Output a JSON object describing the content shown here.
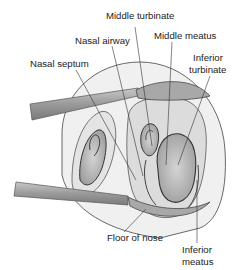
{
  "diagram": {
    "labels": {
      "middle_turbinate": "Middle turbinate",
      "middle_meatus": "Middle meatus",
      "nasal_airway": "Nasal airway",
      "nasal_septum": "Nasal septum",
      "inferior_turbinate_1": "Inferior",
      "inferior_turbinate_2": "turbinate",
      "floor_of_nose": "Floor of nose",
      "inferior_meatus_1": "Inferior",
      "inferior_meatus_2": "meatus"
    },
    "colors": {
      "tissue_light": "#e8e8e8",
      "tissue_mid": "#c4c4c4",
      "tissue_dark": "#8c8c8c",
      "outline": "#3a3a3a",
      "instrument": "#9a9a9a",
      "leader_line": "#333333"
    }
  }
}
